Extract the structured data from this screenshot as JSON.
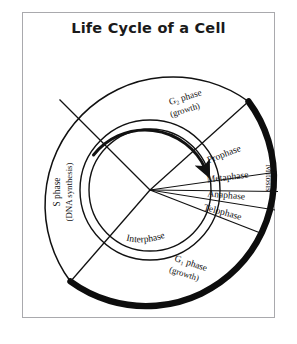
{
  "title": "Life Cycle of a Cell",
  "diagram": {
    "type": "cell-cycle-wheel",
    "center": {
      "x": 150,
      "y": 190
    },
    "outer_radius": 128,
    "inner_ring_outer_radius": 70,
    "inner_ring_inner_radius": 61,
    "rotation_direction": "clockwise",
    "interphase_label": "Interphase",
    "mitosis_label": "Mitosis",
    "phases": [
      {
        "id": "g2",
        "name": "G₂ phase",
        "sub": "(growth)",
        "group": "interphase"
      },
      {
        "id": "s",
        "name": "S phase",
        "sub": "(DNA synthesis)",
        "group": "interphase"
      },
      {
        "id": "g1",
        "name": "G₁ phase",
        "sub": "(growth)",
        "group": "interphase"
      }
    ],
    "mitosis_stages": [
      {
        "id": "prophase",
        "name": "Prophase"
      },
      {
        "id": "metaphase",
        "name": "Metaphase"
      },
      {
        "id": "anaphase",
        "name": "Anaphase"
      },
      {
        "id": "telophase",
        "name": "Telophase"
      }
    ],
    "colors": {
      "stroke": "#111111",
      "thick_arc": "#0d0d0d",
      "frame": "#a9a9ad",
      "background": "#ffffff",
      "text": "#111111"
    }
  }
}
